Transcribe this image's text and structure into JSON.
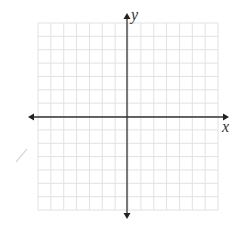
{
  "diagram": {
    "type": "coordinate-plane",
    "x_axis_label": "x",
    "y_axis_label": "y",
    "grid": {
      "columns": 14,
      "rows": 14,
      "left": 38,
      "top": 23,
      "cell_width": 12.86,
      "cell_height": 13.36
    },
    "origin": {
      "x": 127,
      "y": 117
    },
    "x_axis": {
      "from": 28,
      "to": 229
    },
    "y_axis": {
      "from": 13,
      "to": 219
    },
    "colors": {
      "grid": "#e2e2e2",
      "axis": "#333333",
      "stray_mark": "#d8d8d8"
    }
  }
}
